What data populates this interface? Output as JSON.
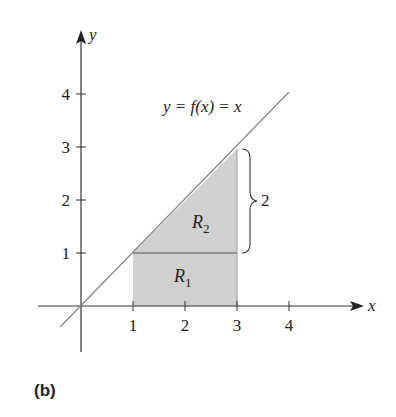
{
  "figure": {
    "caption": "(b)",
    "function_label": "y = f(x) = x",
    "x_axis_label": "x",
    "y_axis_label": "y",
    "x_ticks": [
      "1",
      "2",
      "3",
      "4"
    ],
    "y_ticks": [
      "1",
      "2",
      "3",
      "4"
    ],
    "regions": [
      {
        "name": "R",
        "sub": "1"
      },
      {
        "name": "R",
        "sub": "2"
      }
    ],
    "brace_label": "2",
    "colors": {
      "shade": "#cfcfcf",
      "line": "#8a8a8a",
      "axis": "#333333"
    }
  }
}
